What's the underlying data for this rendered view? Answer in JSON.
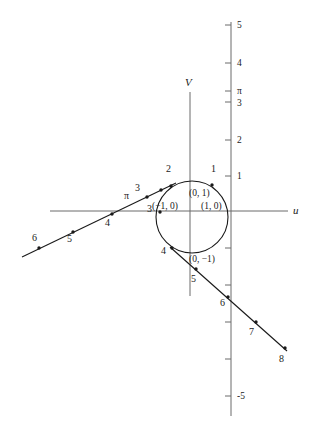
{
  "figure": {
    "title": "",
    "axes": {
      "horizontal": {
        "label": "u",
        "y_pixel": 211,
        "x_start": 50,
        "x_end": 288
      },
      "vertical_v": {
        "label": "V",
        "x_pixel": 190,
        "y_start": 92,
        "y_end": 296
      },
      "vertical_scale": {
        "x_pixel": 231,
        "y_start": 22,
        "y_end": 416
      }
    },
    "scale_ticks": [
      {
        "label": "5",
        "value": 5,
        "y": 25,
        "show_label": true
      },
      {
        "label": "4",
        "value": 4,
        "y": 63,
        "show_label": true
      },
      {
        "label": "π",
        "value": 3.1416,
        "y": 91,
        "show_label": true
      },
      {
        "label": "3",
        "value": 3,
        "y": 102,
        "show_label": true
      },
      {
        "label": "2",
        "value": 2,
        "y": 140,
        "show_label": true
      },
      {
        "label": "1",
        "value": 1,
        "y": 176,
        "show_label": true
      },
      {
        "label": "",
        "value": -1,
        "y": 248,
        "show_label": false
      },
      {
        "label": "",
        "value": -2,
        "y": 285,
        "show_label": false
      },
      {
        "label": "",
        "value": -3,
        "y": 322,
        "show_label": false
      },
      {
        "label": "",
        "value": -4,
        "y": 359,
        "show_label": false
      },
      {
        "label": "-5",
        "value": -5,
        "y": 396,
        "show_label": true
      }
    ],
    "curve_points": [
      {
        "label": "1",
        "x": 212,
        "y": 185,
        "label_x": 211,
        "label_y": 172
      },
      {
        "label": "2",
        "x": 171,
        "y": 186,
        "label_x": 166,
        "label_y": 172
      },
      {
        "label": "π",
        "x": 140,
        "y": 198,
        "label_x": 128,
        "label_y": 194
      },
      {
        "label": "3",
        "x": 157,
        "y": 196,
        "label_x": 138,
        "label_y": 188
      },
      {
        "label": "3",
        "x": 160,
        "y": 209,
        "label_x": 147,
        "label_y": 211
      },
      {
        "label": "4",
        "x": 110,
        "y": 215,
        "label_x": 108,
        "label_y": 227
      },
      {
        "label": "4",
        "x": 172,
        "y": 249,
        "label_x": 163,
        "label_y": 252
      },
      {
        "label": "5",
        "x": 73,
        "y": 231,
        "label_x": 69,
        "label_y": 243
      },
      {
        "label": "5",
        "x": 195,
        "y": 268,
        "label_x": 193,
        "label_y": 282
      },
      {
        "label": "6",
        "x": 38,
        "y": 248,
        "label_x": 34,
        "label_y": 240
      },
      {
        "label": "6",
        "x": 228,
        "y": 293,
        "label_x": 222,
        "label_y": 305
      },
      {
        "label": "7",
        "x": 256,
        "y": 323,
        "label_x": 249,
        "label_y": 337
      },
      {
        "label": "8",
        "x": 285,
        "y": 350,
        "label_x": 280,
        "label_y": 364
      }
    ],
    "coordinate_labels": [
      {
        "text": "(0, 1)",
        "x": 193,
        "y": 193
      },
      {
        "text": "(−1, 0)",
        "x": 155,
        "y": 208
      },
      {
        "text": "(1, 0)",
        "x": 203,
        "y": 208
      },
      {
        "text": "(0, −1)",
        "x": 193,
        "y": 260
      }
    ],
    "circle": {
      "cx": 192,
      "cy": 217,
      "r": 36
    },
    "line_upper": {
      "x1": 22,
      "y1": 257,
      "x2": 177,
      "y2": 182
    },
    "line_lower": {
      "x1": 170,
      "y1": 247,
      "x2": 287,
      "y2": 351
    },
    "colors": {
      "axis": "#6b6b6b",
      "curve": "#1a1a1a",
      "background": "#ffffff",
      "text": "#1a1a1a"
    }
  }
}
